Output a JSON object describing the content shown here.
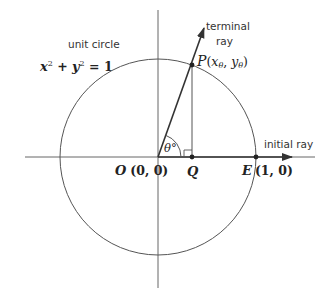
{
  "diagram": {
    "labels": {
      "unit_circle": "unit circle",
      "equation_x": "x",
      "equation_sup1": "2",
      "equation_plus": " + ",
      "equation_y": "y",
      "equation_sup2": "2",
      "equation_rest": " = 1",
      "terminal_line1": "terminal",
      "terminal_line2": "ray",
      "initial_ray": "initial ray",
      "point_P": "P",
      "point_P_coords_open": "(",
      "point_P_x": "x",
      "point_P_sub_x": "θ",
      "point_P_comma": ", ",
      "point_P_y": "y",
      "point_P_sub_y": "θ",
      "point_P_coords_close": ")",
      "point_O": "O",
      "point_O_coords": "(0, 0)",
      "point_Q": "Q",
      "point_E": "E",
      "point_E_coords": "(1, 0)",
      "angle": "θ°"
    },
    "geometry": {
      "origin": [
        158,
        157
      ],
      "radius": 98,
      "point_P": [
        192,
        65
      ],
      "point_Q": [
        192,
        157
      ],
      "point_E": [
        256,
        157
      ]
    },
    "colors": {
      "stroke": "#555555",
      "dark": "#222222",
      "text": "#333333"
    }
  }
}
